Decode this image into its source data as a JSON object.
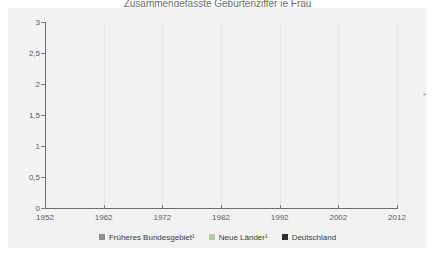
{
  "title_partial": "Zusammengefasste Geburtenziffer je Frau",
  "axes": {
    "y_ticks": [
      "0",
      "0,5",
      "1",
      "1,5",
      "2",
      "2,5",
      "3"
    ],
    "y_values": [
      0,
      0.5,
      1,
      1.5,
      2,
      2.5,
      3
    ],
    "x_ticks": [
      "1952",
      "1962",
      "1972",
      "1982",
      "1992",
      "2002",
      "2012"
    ],
    "x_values": [
      1952,
      1962,
      1972,
      1982,
      1992,
      2002,
      2012
    ]
  },
  "legend": {
    "items": [
      {
        "label": "Früheres Bundesgebiet¹",
        "color": "#8e8e8e",
        "swatch": "legend-swatch-frueheres-bundesgebiet"
      },
      {
        "label": "Neue Länder¹",
        "color": "#b9c9ab",
        "swatch": "legend-swatch-neue-laender"
      },
      {
        "label": "Deutschland",
        "color": "#2f2f2f",
        "swatch": "legend-swatch-deutschland"
      }
    ]
  },
  "footnote_mark": "*",
  "chart_data": {
    "type": "line",
    "title": "Zusammengefasste Geburtenziffer je Frau",
    "xlabel": "",
    "ylabel": "",
    "xlim": [
      1952,
      2012
    ],
    "ylim": [
      0,
      3
    ],
    "grid": "vertical-decades",
    "legend_position": "bottom-center",
    "series": [
      {
        "name": "Früheres Bundesgebiet¹",
        "color": "#8e8e8e",
        "x": [
          1952,
          1953,
          1954,
          1955,
          1956,
          1957,
          1958,
          1959,
          1960,
          1961,
          1962,
          1963,
          1964,
          1965,
          1966,
          1967,
          1968,
          1969,
          1970,
          1971,
          1972,
          1973,
          1974,
          1975,
          1976,
          1977,
          1978,
          1979,
          1980,
          1981,
          1982,
          1983,
          1984,
          1985,
          1986,
          1987,
          1988,
          1989,
          1990,
          1991,
          1992,
          1993,
          1994,
          1995,
          1996,
          1997,
          1998,
          1999,
          2000,
          2001,
          2002,
          2003,
          2004,
          2005,
          2006,
          2007,
          2008,
          2009,
          2010,
          2011
        ],
        "values": [
          2.06,
          2.04,
          2.07,
          2.11,
          2.19,
          2.25,
          2.26,
          2.36,
          2.37,
          2.45,
          2.44,
          2.52,
          2.54,
          2.51,
          2.53,
          2.48,
          2.38,
          2.21,
          2.02,
          1.92,
          1.71,
          1.54,
          1.51,
          1.45,
          1.46,
          1.4,
          1.38,
          1.39,
          1.45,
          1.43,
          1.41,
          1.33,
          1.29,
          1.28,
          1.34,
          1.37,
          1.41,
          1.39,
          1.45,
          1.42,
          1.4,
          1.39,
          1.35,
          1.34,
          1.39,
          1.41,
          1.41,
          1.41,
          1.41,
          1.38,
          1.36,
          1.36,
          1.37,
          1.36,
          1.34,
          1.37,
          1.37,
          1.36,
          1.39,
          1.38
        ]
      },
      {
        "name": "Neue Länder¹",
        "color": "#b9c9ab",
        "x": [
          1952,
          1953,
          1954,
          1955,
          1956,
          1957,
          1958,
          1959,
          1960,
          1961,
          1962,
          1963,
          1964,
          1965,
          1966,
          1967,
          1968,
          1969,
          1970,
          1971,
          1972,
          1973,
          1974,
          1975,
          1976,
          1977,
          1978,
          1979,
          1980,
          1981,
          1982,
          1983,
          1984,
          1985,
          1986,
          1987,
          1988,
          1989,
          1990,
          1991,
          1992,
          1993,
          1994,
          1995,
          1996,
          1997,
          1998,
          1999,
          2000,
          2001,
          2002,
          2003,
          2004,
          2005,
          2006,
          2007,
          2008,
          2009,
          2010,
          2011
        ],
        "values": [
          2.45,
          2.41,
          2.38,
          2.28,
          2.22,
          2.21,
          2.25,
          2.37,
          2.35,
          2.42,
          2.47,
          2.48,
          2.51,
          2.48,
          2.43,
          2.35,
          2.3,
          2.24,
          2.19,
          2.13,
          1.79,
          1.58,
          1.54,
          1.54,
          1.64,
          1.85,
          1.9,
          1.9,
          1.94,
          1.86,
          1.86,
          1.79,
          1.74,
          1.73,
          1.7,
          1.74,
          1.67,
          1.57,
          1.52,
          0.98,
          0.83,
          0.77,
          0.77,
          0.84,
          0.95,
          1.04,
          1.09,
          1.15,
          1.21,
          1.23,
          1.24,
          1.26,
          1.31,
          1.3,
          1.3,
          1.37,
          1.4,
          1.4,
          1.46,
          1.43
        ]
      },
      {
        "name": "Deutschland",
        "color": "#2f2f2f",
        "x": [
          1990,
          1991,
          1992,
          1993,
          1994,
          1995,
          1996,
          1997,
          1998,
          1999,
          2000,
          2001,
          2002,
          2003,
          2004,
          2005,
          2006,
          2007,
          2008,
          2009,
          2010,
          2011
        ],
        "values": [
          1.45,
          1.33,
          1.29,
          1.28,
          1.24,
          1.25,
          1.32,
          1.37,
          1.36,
          1.36,
          1.38,
          1.35,
          1.34,
          1.34,
          1.36,
          1.34,
          1.33,
          1.37,
          1.38,
          1.36,
          1.39,
          1.36
        ]
      }
    ]
  }
}
